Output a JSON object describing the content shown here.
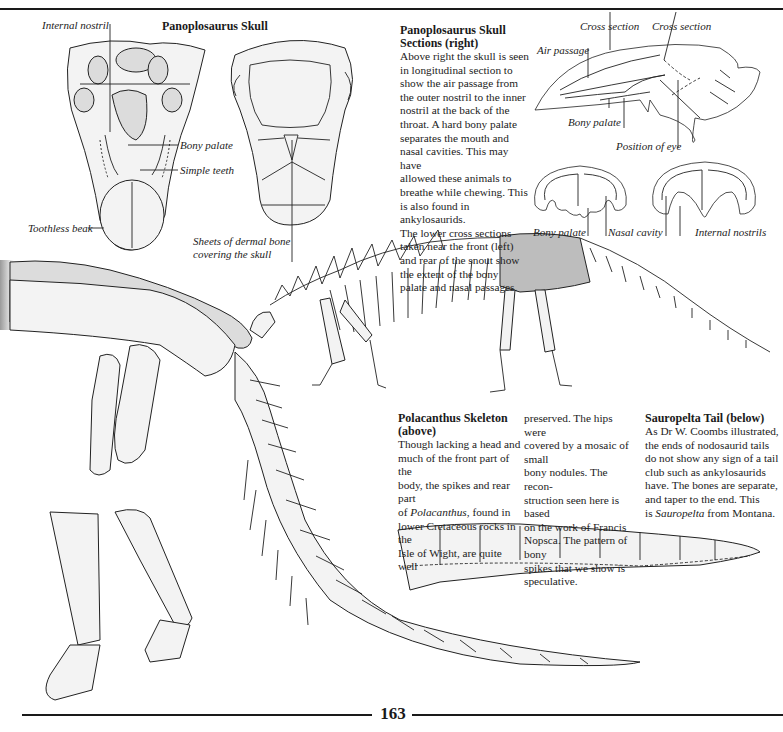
{
  "page": {
    "number": "163"
  },
  "skull_figure": {
    "title": "Panoplosaurus Skull",
    "labels": {
      "internal_nostril": "Internal nostril",
      "bony_palate": "Bony palate",
      "simple_teeth": "Simple teeth",
      "toothless_beak": "Toothless beak",
      "dermal_bone_line1": "Sheets of dermal bone",
      "dermal_bone_line2": "covering the skull"
    }
  },
  "skull_sections": {
    "heading_line1": "Panoplosaurus Skull",
    "heading_line2": "Sections (right)",
    "body": [
      "Above right the skull is seen",
      "in longitudinal section to",
      "show the air passage from",
      "the outer nostril to the inner",
      "nostril at the back of the",
      "throat. A hard bony palate",
      "separates the mouth and",
      "nasal cavities. This may have",
      "allowed these animals to",
      "breathe while chewing. This",
      "is also found in ankylosaurids.",
      "The lower cross sections",
      "taken near the front (left)",
      "and rear of the snout show",
      "the extent of the bony",
      "palate and nasal passages."
    ],
    "labels": {
      "cross_section_1": "Cross section",
      "cross_section_2": "Cross section",
      "air_passage": "Air passage",
      "bony_palate": "Bony palate",
      "position_of_eye": "Position of eye",
      "bony_palate_cs": "Bony palate",
      "nasal_cavity": "Nasal cavity",
      "internal_nostrils": "Internal nostrils"
    }
  },
  "polacanthus": {
    "heading_line1": "Polacanthus Skeleton",
    "heading_line2": "(above)",
    "col1": [
      "Though lacking a head and",
      "much of the front part of the",
      "body, the spikes and rear part",
      "of Polacanthus, found in",
      "lower Cretaceous rocks in the",
      "Isle of Wight, are quite well"
    ],
    "col2": [
      "preserved. The hips were",
      "covered by a mosaic of small",
      "bony nodules. The recon-",
      "struction seen here is based",
      "on the work of Francis",
      "Nopsca. The pattern of bony",
      "spikes that we show is",
      "speculative."
    ],
    "italic_word": "Polacanthus"
  },
  "sauropelta": {
    "heading": "Sauropelta Tail (below)",
    "body": [
      "As Dr W. Coombs illustrated,",
      "the ends of nodosaurid tails",
      "do not show any sign of a tail",
      "club such as ankylosaurids",
      "have. The bones are separate,",
      "and taper to the end. This",
      "is Sauropelta from Montana."
    ],
    "italic_word": "Sauropelta"
  }
}
